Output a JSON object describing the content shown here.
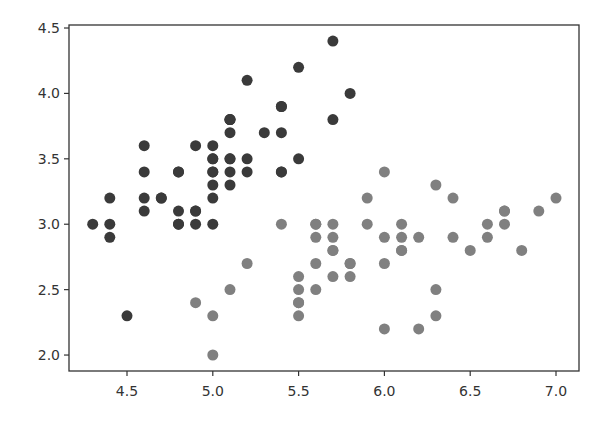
{
  "chart_data": {
    "type": "scatter",
    "title": "",
    "xlabel": "",
    "ylabel": "",
    "xlim": [
      4.162,
      7.134
    ],
    "ylim": [
      1.878,
      4.523
    ],
    "grid": false,
    "legend": null,
    "xticks": [
      4.5,
      5.0,
      5.5,
      6.0,
      6.5,
      7.0
    ],
    "xtick_labels": [
      "4.5",
      "5.0",
      "5.5",
      "6.0",
      "6.5",
      "7.0"
    ],
    "yticks": [
      2.0,
      2.5,
      3.0,
      3.5,
      4.0,
      4.5
    ],
    "ytick_labels": [
      "2.0",
      "2.5",
      "3.0",
      "3.5",
      "4.0",
      "4.5"
    ],
    "series": [
      {
        "name": "dark",
        "color": "#3a3a3a",
        "points": [
          [
            5.1,
            3.5
          ],
          [
            4.9,
            3.0
          ],
          [
            4.7,
            3.2
          ],
          [
            4.6,
            3.1
          ],
          [
            5.0,
            3.6
          ],
          [
            5.4,
            3.9
          ],
          [
            4.6,
            3.4
          ],
          [
            5.0,
            3.4
          ],
          [
            4.4,
            2.9
          ],
          [
            4.9,
            3.1
          ],
          [
            5.4,
            3.7
          ],
          [
            4.8,
            3.4
          ],
          [
            4.8,
            3.0
          ],
          [
            4.3,
            3.0
          ],
          [
            5.8,
            4.0
          ],
          [
            5.7,
            4.4
          ],
          [
            5.4,
            3.9
          ],
          [
            5.1,
            3.5
          ],
          [
            5.7,
            3.8
          ],
          [
            5.1,
            3.8
          ],
          [
            5.4,
            3.4
          ],
          [
            5.1,
            3.7
          ],
          [
            4.6,
            3.6
          ],
          [
            5.1,
            3.3
          ],
          [
            4.8,
            3.4
          ],
          [
            5.0,
            3.0
          ],
          [
            5.0,
            3.4
          ],
          [
            5.2,
            3.5
          ],
          [
            5.2,
            3.4
          ],
          [
            4.7,
            3.2
          ],
          [
            4.8,
            3.1
          ],
          [
            5.4,
            3.4
          ],
          [
            5.2,
            4.1
          ],
          [
            5.5,
            4.2
          ],
          [
            4.9,
            3.1
          ],
          [
            5.0,
            3.2
          ],
          [
            5.5,
            3.5
          ],
          [
            4.9,
            3.6
          ],
          [
            4.4,
            3.0
          ],
          [
            5.1,
            3.4
          ],
          [
            5.0,
            3.5
          ],
          [
            4.5,
            2.3
          ],
          [
            4.4,
            3.2
          ],
          [
            5.0,
            3.5
          ],
          [
            5.1,
            3.8
          ],
          [
            4.8,
            3.0
          ],
          [
            5.1,
            3.8
          ],
          [
            4.6,
            3.2
          ],
          [
            5.3,
            3.7
          ],
          [
            5.0,
            3.3
          ]
        ]
      },
      {
        "name": "gray",
        "color": "#808080",
        "points": [
          [
            7.0,
            3.2
          ],
          [
            6.4,
            3.2
          ],
          [
            6.9,
            3.1
          ],
          [
            5.5,
            2.3
          ],
          [
            6.5,
            2.8
          ],
          [
            5.7,
            2.8
          ],
          [
            6.3,
            3.3
          ],
          [
            4.9,
            2.4
          ],
          [
            6.6,
            2.9
          ],
          [
            5.2,
            2.7
          ],
          [
            5.0,
            2.0
          ],
          [
            5.9,
            3.0
          ],
          [
            6.0,
            2.2
          ],
          [
            6.1,
            2.9
          ],
          [
            5.6,
            2.9
          ],
          [
            6.7,
            3.1
          ],
          [
            5.6,
            3.0
          ],
          [
            5.8,
            2.7
          ],
          [
            6.2,
            2.2
          ],
          [
            5.6,
            2.5
          ],
          [
            5.9,
            3.2
          ],
          [
            6.1,
            2.8
          ],
          [
            6.3,
            2.5
          ],
          [
            6.1,
            2.8
          ],
          [
            6.4,
            2.9
          ],
          [
            6.6,
            3.0
          ],
          [
            6.8,
            2.8
          ],
          [
            6.7,
            3.0
          ],
          [
            6.0,
            2.9
          ],
          [
            5.7,
            2.6
          ],
          [
            5.5,
            2.4
          ],
          [
            5.5,
            2.4
          ],
          [
            5.8,
            2.7
          ],
          [
            6.0,
            2.7
          ],
          [
            5.4,
            3.0
          ],
          [
            6.0,
            3.4
          ],
          [
            6.7,
            3.1
          ],
          [
            6.3,
            2.3
          ],
          [
            5.6,
            3.0
          ],
          [
            5.5,
            2.5
          ],
          [
            5.5,
            2.6
          ],
          [
            6.1,
            3.0
          ],
          [
            5.8,
            2.6
          ],
          [
            5.0,
            2.3
          ],
          [
            5.6,
            2.7
          ],
          [
            5.7,
            3.0
          ],
          [
            5.7,
            2.9
          ],
          [
            6.2,
            2.9
          ],
          [
            5.1,
            2.5
          ],
          [
            5.7,
            2.8
          ]
        ]
      }
    ]
  }
}
